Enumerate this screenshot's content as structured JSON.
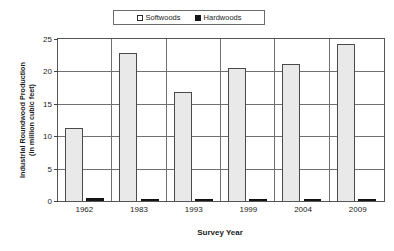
{
  "chart_data": {
    "type": "bar",
    "title": "",
    "subtitle": "",
    "xlabel": "Survey Year",
    "ylabel": "Industrial Roundwood Production (in million cubic feet)",
    "ylabel_lines": [
      "Industrial Roundwood Production",
      "(in million cubic feet)"
    ],
    "categories": [
      "1962",
      "1983",
      "1993",
      "1999",
      "2004",
      "2009"
    ],
    "series": [
      {
        "name": "Softwoods",
        "marker": "hollow-square",
        "color": "#e9e9e9",
        "edge_color": "#4a4a4a",
        "values": [
          11.2,
          22.9,
          16.8,
          20.5,
          21.2,
          24.3
        ]
      },
      {
        "name": "Hardwoods",
        "marker": "solid-square",
        "color": "#161616",
        "edge_color": "#101010",
        "values": [
          0.5,
          0.25,
          0.2,
          0.2,
          0.08,
          0.06
        ]
      }
    ],
    "ylim": [
      0,
      25
    ],
    "yticks": [
      0,
      5,
      10,
      15,
      20,
      25
    ],
    "ytick_labels": [
      "0",
      "5",
      "10",
      "15",
      "20",
      "25"
    ],
    "grid": "horizontal-and-vertical-separators",
    "legend_position": "top-center",
    "legend_entries": [
      "Softwoods",
      "Hardwoods"
    ]
  }
}
